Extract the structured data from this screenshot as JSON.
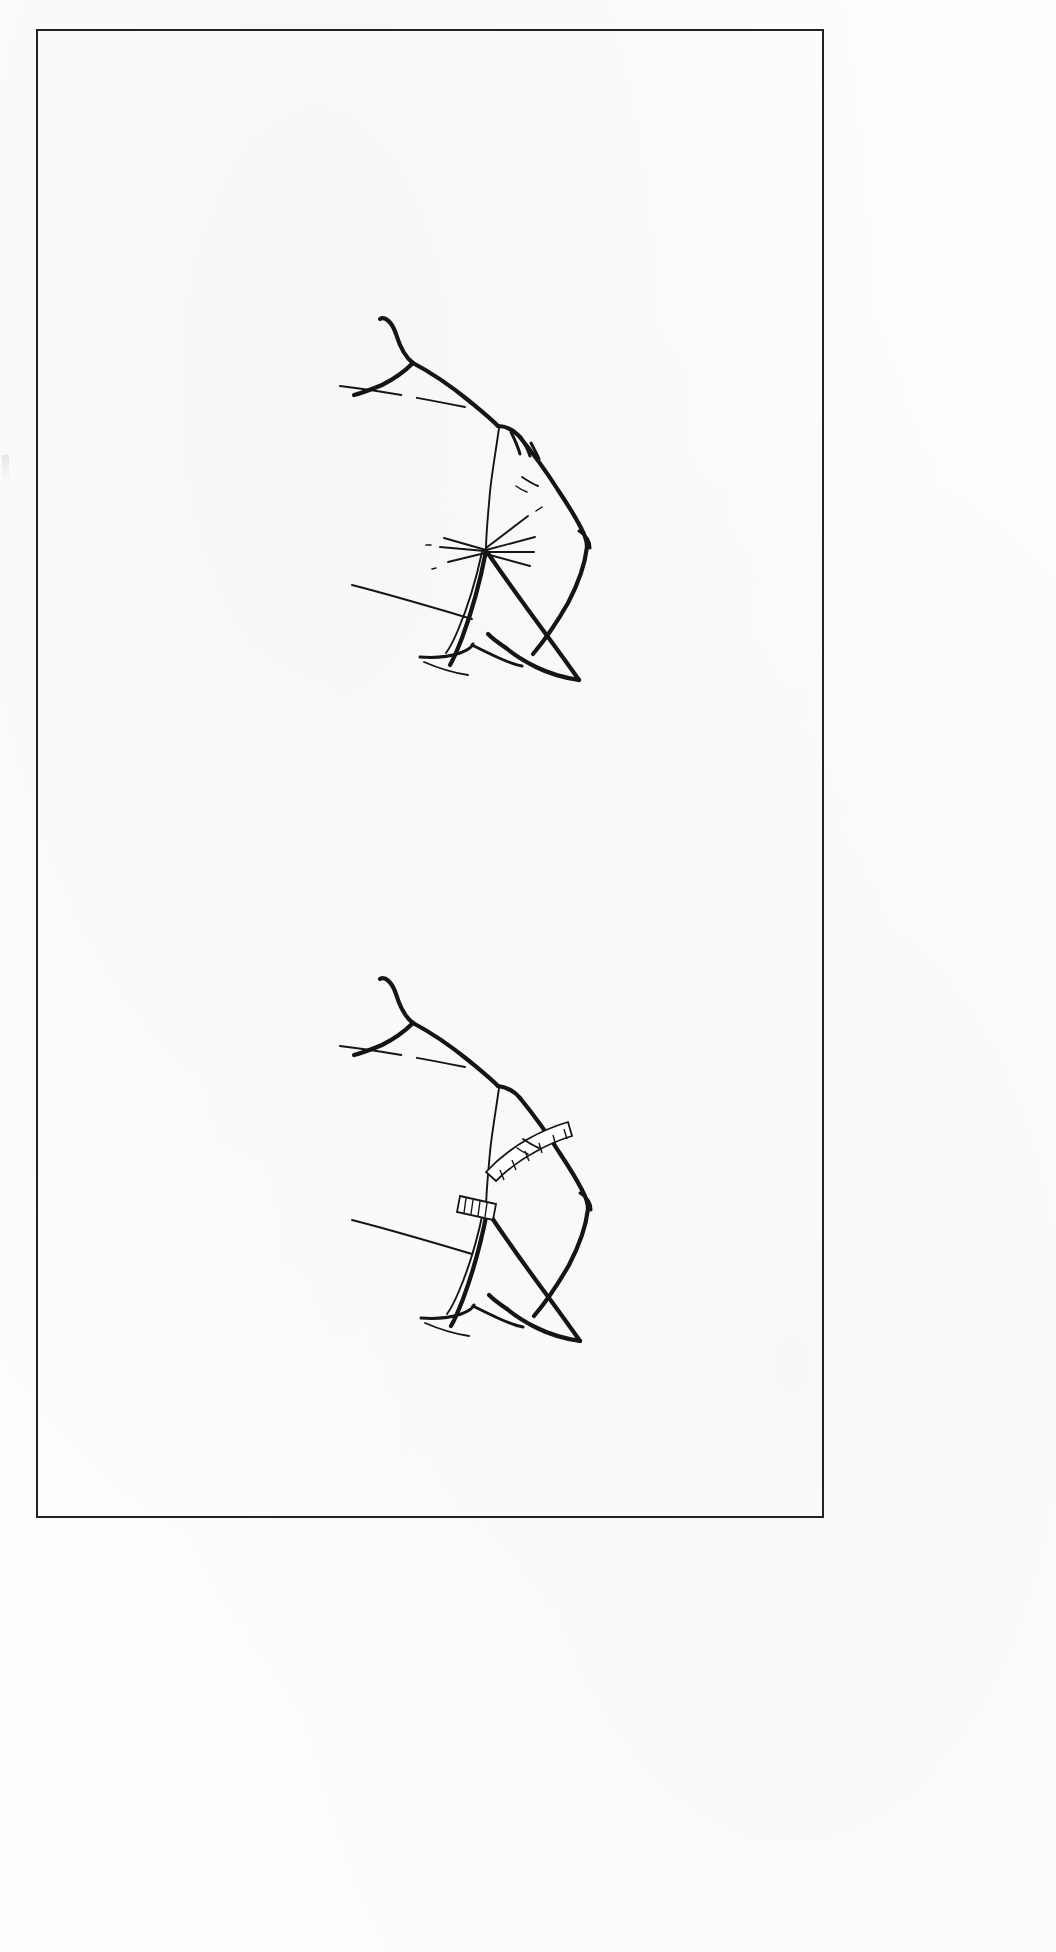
{
  "page": {
    "kind": "illustration-page",
    "background_color": "#fdfdfc",
    "border_color": "#222222",
    "ink_color": "#151515",
    "width": 1056,
    "height": 1952,
    "caption": "",
    "page_number": "",
    "header": "",
    "footer": ""
  },
  "margin_artifact": {
    "name": "edge-speck",
    "visible": true
  },
  "figures": [
    {
      "id": "figure-top",
      "title": "",
      "label": "",
      "description": "Line drawing of a bodice shoulder, neckline and set-in sleeve bent at the elbow, with a dashed chest line and radiating ease wrinkles at the underarm.",
      "has_tape_measure": false,
      "features": [
        "neckline",
        "shoulder-seam",
        "armhole-seam",
        "sleeve-cap-gathers",
        "dashed-chest-line",
        "underarm-wrinkles",
        "elbow-crease",
        "cuff-opening"
      ]
    },
    {
      "id": "figure-bottom",
      "title": "",
      "label": "",
      "description": "The same bodice and sleeve with a tape measure laid over the sleeve cap and around the upper arm to measure the armhole and bicep.",
      "has_tape_measure": true,
      "features": [
        "neckline",
        "shoulder-seam",
        "armhole-seam",
        "dashed-chest-line",
        "tape-measure-over-cap",
        "tape-measure-around-arm",
        "elbow-crease",
        "cuff-opening"
      ]
    }
  ],
  "colors": {
    "ink": "#151515",
    "paper": "#fdfdfc",
    "frame": "#222222",
    "tape": "#ffffff"
  }
}
